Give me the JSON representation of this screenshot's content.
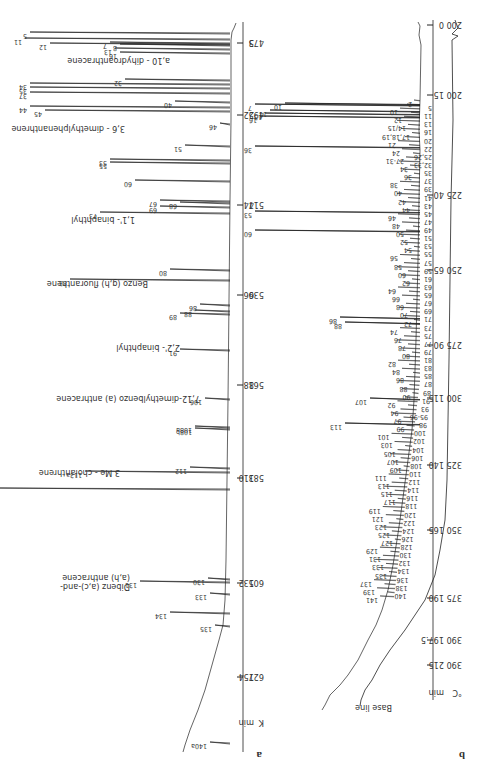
{
  "figure": {
    "orientation": "rotated 180 degrees",
    "panel_a_label": "a",
    "panel_b_label": "b"
  },
  "chart_data": [
    {
      "type": "line",
      "panel": "a",
      "title": "",
      "description": "Capillary gas chromatogram (peaks numbered, selected compounds named)",
      "xlabel": "min / K",
      "axis_ticks": [
        {
          "min": "5",
          "K": "473",
          "y": 43
        },
        {
          "min": "22",
          "K": "495",
          "y": 115
        },
        {
          "min": "44",
          "K": "517",
          "y": 205
        },
        {
          "min": "66",
          "K": "539",
          "y": 295
        },
        {
          "min": "88",
          "K": "561",
          "y": 385
        },
        {
          "min": "110",
          "K": "583",
          "y": 478
        },
        {
          "min": "132",
          "K": "605",
          "y": 583
        },
        {
          "min": "154",
          "K": "627",
          "y": 677
        }
      ],
      "axis_unit_labels": [
        "min",
        "K"
      ],
      "peaks": [
        {
          "id": "5",
          "y": 32,
          "len": 200
        },
        {
          "id": "11",
          "y": 38,
          "len": 205
        },
        {
          "id": "12",
          "y": 43,
          "len": 180
        },
        {
          "id": "7",
          "y": 42,
          "len": 120
        },
        {
          "id": "8",
          "y": 44,
          "len": 110
        },
        {
          "id": "13",
          "y": 48,
          "len": 115
        },
        {
          "id": "16",
          "y": 52,
          "len": 110
        },
        {
          "id": "32",
          "y": 79,
          "len": 105
        },
        {
          "id": "34",
          "y": 83,
          "len": 200
        },
        {
          "id": "35",
          "y": 87,
          "len": 200
        },
        {
          "id": "37",
          "y": 92,
          "len": 200
        },
        {
          "id": "40",
          "y": 101,
          "len": 55
        },
        {
          "id": "44",
          "y": 106,
          "len": 200
        },
        {
          "id": "45",
          "y": 110,
          "len": 185
        },
        {
          "id": "46",
          "y": 123,
          "len": 10
        },
        {
          "id": "51",
          "y": 145,
          "len": 45
        },
        {
          "id": "53",
          "y": 159,
          "len": 120
        },
        {
          "id": "55",
          "y": 162,
          "len": 120
        },
        {
          "id": "60",
          "y": 180,
          "len": 95
        },
        {
          "id": "67",
          "y": 200,
          "len": 70
        },
        {
          "id": "68",
          "y": 202,
          "len": 50
        },
        {
          "id": "69",
          "y": 206,
          "len": 70
        },
        {
          "id": "73",
          "y": 212,
          "len": 130
        },
        {
          "id": "80",
          "y": 269,
          "len": 60
        },
        {
          "id": "83",
          "y": 279,
          "len": 160
        },
        {
          "id": "86",
          "y": 304,
          "len": 30
        },
        {
          "id": "88",
          "y": 310,
          "len": 35
        },
        {
          "id": "89",
          "y": 313,
          "len": 50
        },
        {
          "id": "91",
          "y": 349,
          "len": 50
        },
        {
          "id": "106",
          "y": 398,
          "len": 25
        },
        {
          "id": "108a",
          "y": 426,
          "len": 35
        },
        {
          "id": "108b",
          "y": 428,
          "len": 35
        },
        {
          "id": "112",
          "y": 467,
          "len": 40
        },
        {
          "id": "113a",
          "y": 471,
          "len": 145
        },
        {
          "id": "116",
          "y": 488,
          "len": 230
        },
        {
          "id": "130",
          "y": 578,
          "len": 22
        },
        {
          "id": "131",
          "y": 581,
          "len": 90
        },
        {
          "id": "133",
          "y": 593,
          "len": 20
        },
        {
          "id": "134",
          "y": 612,
          "len": 60
        },
        {
          "id": "135",
          "y": 625,
          "len": 15
        },
        {
          "id": "140a",
          "y": 742,
          "len": 20
        }
      ],
      "compound_labels": [
        {
          "text": "a,10 - dihydroanthracene",
          "near_peak": "32"
        },
        {
          "text": "3,6 - dimethylphenanthrene",
          "near_peak": "46"
        },
        {
          "text": "1,1'- binaphthyl",
          "near_peak": "73"
        },
        {
          "text": "Benzo (g,h) fluoranthene",
          "near_peak": "83"
        },
        {
          "text": "2,2'- binaphthyl",
          "near_peak": "91"
        },
        {
          "text": "7,12-dimethylbenzo (a) anthracene",
          "near_peak": "106"
        },
        {
          "text": "3 Me - cholanthrene",
          "near_peak": "113a"
        },
        {
          "text": "Dibenz (a,c)-and-",
          "near_peak": "131"
        },
        {
          "text": "(a,h) anthracene",
          "near_peak": "131"
        }
      ]
    },
    {
      "type": "line",
      "panel": "b",
      "title": "",
      "description": "Temperature-programmed gas chromatogram with base line",
      "xlabel": "min / °C",
      "axis_ticks": [
        {
          "min": "0",
          "C": "200",
          "y": 25
        },
        {
          "min": "15",
          "C": "200",
          "y": 95
        },
        {
          "min": "40",
          "C": "225",
          "y": 195
        },
        {
          "min": "65",
          "C": "250",
          "y": 270
        },
        {
          "min": "90",
          "C": "275",
          "y": 345
        },
        {
          "min": "115",
          "C": "300",
          "y": 398
        },
        {
          "min": "140",
          "C": "325",
          "y": 465
        },
        {
          "min": "165",
          "C": "350",
          "y": 530
        },
        {
          "min": "190",
          "C": "375",
          "y": 598
        },
        {
          "min": "197.5",
          "C": "390",
          "y": 640
        },
        {
          "min": "215",
          "C": "390",
          "y": 665
        }
      ],
      "axis_unit_labels": [
        "min",
        "°C"
      ],
      "base_line_label": "Base line",
      "peak_labels": [
        "2",
        "5",
        "10",
        "11",
        "12",
        "13",
        "14/15",
        "16",
        "17,18,19",
        "20",
        "21",
        "22",
        "24",
        "25,26",
        "27-31",
        "32,33",
        "34",
        "35",
        "36",
        "37",
        "38",
        "39",
        "40",
        "41",
        "42",
        "43",
        "44",
        "45",
        "46",
        "47",
        "48",
        "49",
        "50",
        "51",
        "52",
        "53",
        "54",
        "55",
        "56",
        "57",
        "58",
        "59",
        "60",
        "61",
        "62",
        "63",
        "64",
        "65",
        "66",
        "67",
        "68",
        "69",
        "70",
        "71",
        "72",
        "73",
        "74",
        "75",
        "76",
        "77",
        "78",
        "79",
        "80",
        "81",
        "82",
        "83",
        "84",
        "85",
        "86",
        "87",
        "88",
        "89",
        "90",
        "91",
        "92",
        "93",
        "94",
        "95-96",
        "97",
        "98",
        "99",
        "100",
        "101",
        "102",
        "103",
        "104",
        "105",
        "106",
        "107",
        "108",
        "109",
        "110",
        "111",
        "112",
        "113",
        "114",
        "115",
        "116",
        "117",
        "118",
        "119",
        "120",
        "121",
        "122",
        "123",
        "124",
        "125",
        "126",
        "127",
        "128",
        "129",
        "130",
        "131",
        "132",
        "133",
        "134",
        "135",
        "136",
        "137",
        "138",
        "139",
        "140",
        "141"
      ],
      "major_peaks": [
        {
          "id": "10",
          "y": 103,
          "len": 135
        },
        {
          "id": "7",
          "y": 104,
          "len": 165
        },
        {
          "id": "11",
          "y": 110,
          "len": 150
        },
        {
          "id": "13",
          "y": 113,
          "len": 155
        },
        {
          "id": "16",
          "y": 116,
          "len": 160
        },
        {
          "id": "36",
          "y": 146,
          "len": 165
        },
        {
          "id": "53",
          "y": 211,
          "len": 165
        },
        {
          "id": "60",
          "y": 230,
          "len": 165
        },
        {
          "id": "86",
          "y": 317,
          "len": 80
        },
        {
          "id": "88",
          "y": 322,
          "len": 75
        },
        {
          "id": "107",
          "y": 398,
          "len": 50
        },
        {
          "id": "113",
          "y": 423,
          "len": 75
        }
      ]
    }
  ]
}
